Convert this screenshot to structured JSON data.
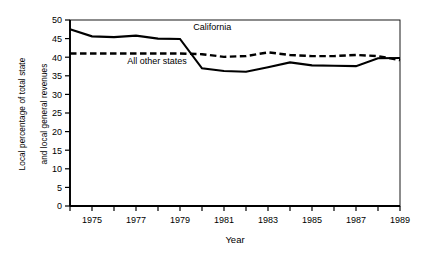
{
  "chart_data": {
    "type": "line",
    "title": "",
    "xlabel": "Year",
    "ylabel_line1": "Local percentage of total state",
    "ylabel_line2": "and local general revenues",
    "xlim": [
      1974,
      1989
    ],
    "ylim": [
      0,
      50
    ],
    "ytick_step": 5,
    "yticks": [
      0,
      5,
      10,
      15,
      20,
      25,
      30,
      35,
      40,
      45,
      50
    ],
    "ytick_labels": [
      "0",
      "5",
      "10",
      "15",
      "20",
      "25",
      "30",
      "35",
      "40",
      "45",
      "50"
    ],
    "xticks": [
      1974,
      1975,
      1976,
      1977,
      1978,
      1979,
      1980,
      1981,
      1982,
      1983,
      1984,
      1985,
      1986,
      1987,
      1988,
      1989
    ],
    "xtick_labels_shown": [
      "1975",
      "1977",
      "1979",
      "1981",
      "1983",
      "1985",
      "1987",
      "1989"
    ],
    "grid": false,
    "legend_position": "inline-annotation",
    "x": [
      1974,
      1975,
      1976,
      1977,
      1978,
      1979,
      1980,
      1981,
      1982,
      1983,
      1984,
      1985,
      1986,
      1987,
      1988,
      1989
    ],
    "series": [
      {
        "name": "California",
        "label": "California",
        "style": "solid",
        "color": "#000000",
        "values": [
          47.5,
          45.6,
          45.4,
          45.8,
          45.0,
          44.9,
          37.0,
          36.3,
          36.1,
          37.3,
          38.6,
          37.8,
          37.7,
          37.6,
          39.7,
          39.8
        ]
      },
      {
        "name": "All other states",
        "label": "All other states",
        "style": "dashed",
        "color": "#000000",
        "values": [
          41.0,
          41.0,
          41.0,
          41.0,
          41.0,
          41.0,
          40.8,
          40.1,
          40.3,
          41.3,
          40.6,
          40.3,
          40.3,
          40.6,
          40.3,
          39.2
        ]
      }
    ],
    "annotations": [
      {
        "text": "California",
        "x": 1979.6,
        "y": 47.2
      },
      {
        "text": "All other states",
        "x": 1976.6,
        "y": 38.3
      }
    ]
  }
}
